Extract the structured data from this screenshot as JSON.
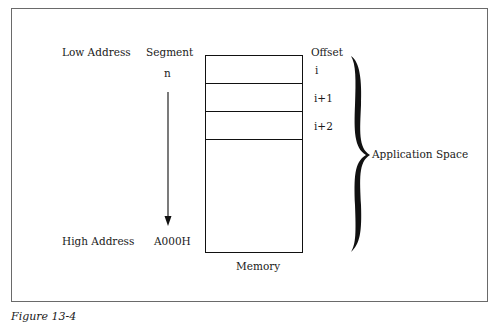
{
  "diagram": {
    "labels": {
      "low_address": "Low Address",
      "high_address": "High Address",
      "segment_header": "Segment",
      "segment_start": "n",
      "segment_end": "A000H",
      "offset_header": "Offset",
      "memory": "Memory",
      "application_space": "Application Space"
    },
    "offsets": [
      "i",
      "i+1",
      "i+2"
    ],
    "caption": "Figure 13-4"
  }
}
